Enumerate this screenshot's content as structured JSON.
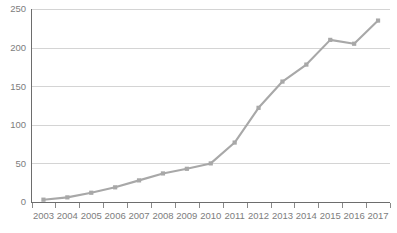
{
  "chart_data": {
    "type": "line",
    "title": "",
    "subtitle": "",
    "xlabel": "",
    "ylabel": "",
    "categories": [
      "2003",
      "2004",
      "2005",
      "2006",
      "2007",
      "2008",
      "2009",
      "2010",
      "2011",
      "2012",
      "2013",
      "2014",
      "2015",
      "2016",
      "2017"
    ],
    "values": [
      3,
      6,
      12,
      19,
      28,
      37,
      43,
      50,
      77,
      122,
      156,
      178,
      210,
      205,
      235
    ],
    "series": [
      {
        "name": "",
        "values": [
          3,
          6,
          12,
          19,
          28,
          37,
          43,
          50,
          77,
          122,
          156,
          178,
          210,
          205,
          235
        ]
      }
    ],
    "ylim": [
      0,
      250
    ],
    "yticks": [
      0,
      50,
      100,
      150,
      200,
      250
    ],
    "ytick_labels": [
      "0",
      "50",
      "100",
      "150",
      "200",
      "250"
    ],
    "xtick_labels": [
      "2003",
      "2004",
      "2005",
      "2006",
      "2007",
      "2008",
      "2009",
      "2010",
      "2011",
      "2012",
      "2013",
      "2014",
      "2015",
      "2016",
      "2017"
    ],
    "grid": true,
    "grid_axis": "y",
    "legend": false,
    "legend_position": "none",
    "annotations": [],
    "colors": {
      "line": "#a8a8a8",
      "marker": "#a8a8a8",
      "gridline": "#d4d4d4",
      "axis": "#6d6d6d",
      "tick_label": "#7d7d7d",
      "background": "#ffffff"
    },
    "marker_style": "square"
  }
}
